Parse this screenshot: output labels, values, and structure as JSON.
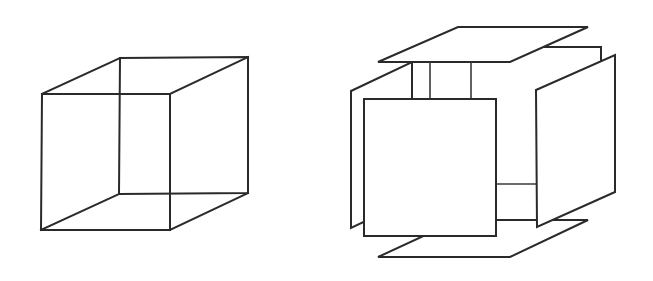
{
  "figure": {
    "colors": {
      "background": "#ffffff",
      "stroke": "#2a2a2a"
    },
    "left": {
      "name": "wireframe-cube",
      "front_face": [
        [
          42,
          94
        ],
        [
          170,
          94
        ],
        [
          170,
          230
        ],
        [
          41,
          230
        ]
      ],
      "back_face": [
        [
          120,
          58
        ],
        [
          248,
          57
        ],
        [
          248,
          193
        ],
        [
          119,
          194
        ]
      ]
    },
    "right": {
      "name": "exploded-cube",
      "panels": [
        "top",
        "bottom",
        "front",
        "back",
        "left",
        "right"
      ],
      "connectors": [
        "top-front-left",
        "top-front-right",
        "front-right-upper",
        "front-right-lower"
      ]
    }
  }
}
